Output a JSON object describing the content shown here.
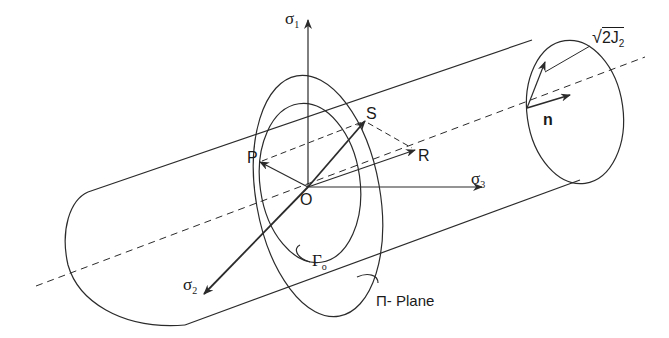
{
  "diagram": {
    "labels": {
      "sigma1": {
        "sym": "σ",
        "sub": "1"
      },
      "sigma2": {
        "sym": "σ",
        "sub": "2"
      },
      "sigma3": {
        "sym": "σ",
        "sub": "3"
      },
      "origin": "O",
      "point_s": "S",
      "point_p": "P",
      "point_r": "R",
      "normal": "n",
      "radius": {
        "root": "√",
        "body": "2J",
        "sub": "2"
      },
      "gamma0": {
        "sym": "Γ",
        "sub": "o"
      },
      "pi_plane": "Π- Plane"
    },
    "colors": {
      "stroke": "#2b2b2b",
      "background": "#ffffff"
    }
  }
}
